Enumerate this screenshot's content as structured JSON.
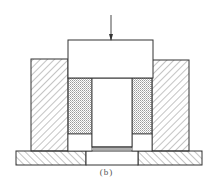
{
  "figure": {
    "caption": "(b)",
    "colors": {
      "line": "#333333",
      "hatch": "#555555",
      "stipple": "#9a9a9a",
      "background": "#ffffff"
    },
    "parts": [
      {
        "name": "force-arrow",
        "label": ""
      },
      {
        "name": "punch",
        "label": ""
      },
      {
        "name": "left-die-block",
        "label": ""
      },
      {
        "name": "right-die-block",
        "label": ""
      },
      {
        "name": "left-powder",
        "label": ""
      },
      {
        "name": "right-powder",
        "label": ""
      },
      {
        "name": "central-core",
        "label": ""
      },
      {
        "name": "base-plate",
        "label": ""
      }
    ]
  }
}
